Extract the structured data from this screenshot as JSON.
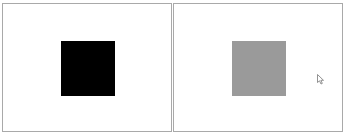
{
  "panels": [
    {
      "id": "left",
      "square_color": "#000000",
      "label": "black square"
    },
    {
      "id": "right",
      "square_color": "#9a9a9a",
      "label": "gray square"
    }
  ],
  "colors": {
    "border": "#a9a9a9",
    "background": "#ffffff"
  },
  "cursor": {
    "icon": "mouse-pointer-icon"
  }
}
